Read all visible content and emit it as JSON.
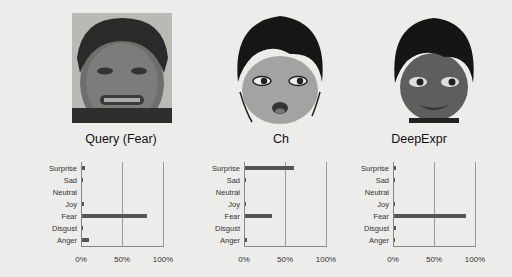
{
  "panels": [
    {
      "caption": "Query (Fear)",
      "kind": "photo"
    },
    {
      "caption": "Ch",
      "kind": "cartoon"
    },
    {
      "caption": "DeepExpr",
      "kind": "cartoon-3d"
    }
  ],
  "axis_ticks": [
    "0%",
    "50%",
    "100%"
  ],
  "categories": [
    "Surprise",
    "Sad",
    "Neutral",
    "Joy",
    "Fear",
    "Disgust",
    "Anger"
  ],
  "chart_data": [
    {
      "type": "bar",
      "orientation": "horizontal",
      "title": "Query (Fear)",
      "categories": [
        "Surprise",
        "Sad",
        "Neutral",
        "Joy",
        "Fear",
        "Disgust",
        "Anger"
      ],
      "values": [
        4,
        0.5,
        0,
        2,
        79,
        0.5,
        8
      ],
      "xlabel": "",
      "ylabel": "",
      "xlim": [
        0,
        100
      ],
      "xticks": [
        "0%",
        "50%",
        "100%"
      ],
      "grid": true
    },
    {
      "type": "bar",
      "orientation": "horizontal",
      "title": "Ch",
      "categories": [
        "Surprise",
        "Sad",
        "Neutral",
        "Joy",
        "Fear",
        "Disgust",
        "Anger"
      ],
      "values": [
        60,
        1,
        0,
        0.5,
        33,
        0,
        2
      ],
      "xlabel": "",
      "ylabel": "",
      "xlim": [
        0,
        100
      ],
      "xticks": [
        "0%",
        "50%",
        "100%"
      ],
      "grid": true
    },
    {
      "type": "bar",
      "orientation": "horizontal",
      "title": "DeepExpr",
      "categories": [
        "Surprise",
        "Sad",
        "Neutral",
        "Joy",
        "Fear",
        "Disgust",
        "Anger"
      ],
      "values": [
        2,
        0.5,
        0,
        0.5,
        88,
        2,
        0.5
      ],
      "xlabel": "",
      "ylabel": "",
      "xlim": [
        0,
        100
      ],
      "xticks": [
        "0%",
        "50%",
        "100%"
      ],
      "grid": true
    }
  ],
  "colors": {
    "bar": "#555555",
    "axis": "#888888",
    "background": "#ececea"
  }
}
